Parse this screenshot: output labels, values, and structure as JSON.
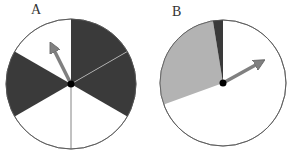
{
  "spinners": [
    {
      "label": "A",
      "sectors": [
        {
          "start_deg": 0,
          "end_deg": 60,
          "color": "#3a3a3a"
        },
        {
          "start_deg": 60,
          "end_deg": 120,
          "color": "#3a3a3a"
        },
        {
          "start_deg": 120,
          "end_deg": 180,
          "color": "#ffffff"
        },
        {
          "start_deg": 180,
          "end_deg": 240,
          "color": "#ffffff"
        },
        {
          "start_deg": 240,
          "end_deg": 300,
          "color": "#3a3a3a"
        },
        {
          "start_deg": 300,
          "end_deg": 360,
          "color": "#ffffff"
        }
      ],
      "arrow_color": "#808080"
    },
    {
      "label": "B",
      "sectors": [
        {
          "color": "#3a3a3a",
          "description": "thin dark sliver"
        },
        {
          "color": "#b3b3b3",
          "description": "light gray sector"
        },
        {
          "color": "#ffffff",
          "description": "large white remainder"
        }
      ],
      "arrow_color": "#808080"
    }
  ]
}
